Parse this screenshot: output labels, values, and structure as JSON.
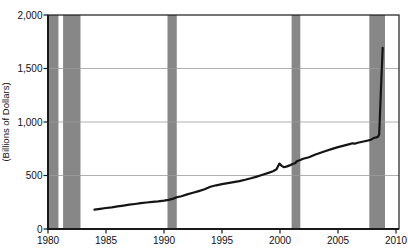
{
  "figure": {
    "title": "",
    "y_axis_title": "(Billions of Dollars)"
  },
  "colors": {
    "line": "#141414",
    "recession_band": "#878787",
    "gridline": "#9c9c9c",
    "frame": "#1a1a1a",
    "text": "#111111",
    "background": "#ffffff"
  },
  "chart_data": {
    "type": "line",
    "title": "",
    "xlabel": "",
    "ylabel": "(Billions of Dollars)",
    "xlim": [
      1980,
      2010.3
    ],
    "ylim": [
      0,
      2000
    ],
    "x_ticks": [
      1980,
      1985,
      1990,
      1995,
      2000,
      2005,
      2010
    ],
    "x_tick_labels": [
      "1980",
      "1985",
      "1990",
      "1995",
      "2000",
      "2005",
      "2010"
    ],
    "y_ticks": [
      0,
      500,
      1000,
      1500,
      2000
    ],
    "y_tick_labels": [
      "0",
      "500",
      "1,000",
      "1,500",
      "2,000"
    ],
    "grid": "horizontal gridlines at 500, 1000, 1500; plot frame on all four sides",
    "legend": "none",
    "recession_bands": [
      [
        1980.0,
        1980.9
      ],
      [
        1981.3,
        1982.8
      ],
      [
        1990.3,
        1991.1
      ],
      [
        2001.0,
        2001.75
      ],
      [
        2007.7,
        2009.05
      ]
    ],
    "series": [
      {
        "name": "monetary-aggregate-line",
        "points": [
          [
            1984,
            180
          ],
          [
            1984.5,
            188
          ],
          [
            1985,
            196
          ],
          [
            1985.5,
            203
          ],
          [
            1986,
            211
          ],
          [
            1986.5,
            219
          ],
          [
            1987,
            227
          ],
          [
            1987.5,
            234
          ],
          [
            1988,
            241
          ],
          [
            1988.5,
            248
          ],
          [
            1989,
            254
          ],
          [
            1989.5,
            259
          ],
          [
            1990,
            265
          ],
          [
            1990.4,
            272
          ],
          [
            1990.8,
            284
          ],
          [
            1991.1,
            296
          ],
          [
            1991.5,
            307
          ],
          [
            1992,
            323
          ],
          [
            1992.5,
            338
          ],
          [
            1993,
            354
          ],
          [
            1993.5,
            371
          ],
          [
            1994,
            395
          ],
          [
            1994.5,
            408
          ],
          [
            1995,
            420
          ],
          [
            1995.5,
            429
          ],
          [
            1996,
            438
          ],
          [
            1996.5,
            448
          ],
          [
            1997,
            460
          ],
          [
            1997.5,
            474
          ],
          [
            1998,
            490
          ],
          [
            1998.5,
            507
          ],
          [
            1999,
            524
          ],
          [
            1999.4,
            540
          ],
          [
            1999.7,
            558
          ],
          [
            1999.95,
            611
          ],
          [
            2000.15,
            590
          ],
          [
            2000.35,
            578
          ],
          [
            2000.6,
            585
          ],
          [
            2000.9,
            597
          ],
          [
            2001.15,
            610
          ],
          [
            2001.3,
            614
          ],
          [
            2001.45,
            634
          ],
          [
            2001.7,
            642
          ],
          [
            2002,
            656
          ],
          [
            2002.5,
            671
          ],
          [
            2003,
            693
          ],
          [
            2003.5,
            713
          ],
          [
            2004,
            731
          ],
          [
            2004.5,
            749
          ],
          [
            2005,
            765
          ],
          [
            2005.5,
            779
          ],
          [
            2006,
            793
          ],
          [
            2006.25,
            801
          ],
          [
            2006.45,
            797
          ],
          [
            2006.7,
            806
          ],
          [
            2007,
            813
          ],
          [
            2007.5,
            825
          ],
          [
            2007.8,
            833
          ],
          [
            2008,
            845
          ],
          [
            2008.15,
            852
          ],
          [
            2008.3,
            856
          ],
          [
            2008.45,
            862
          ],
          [
            2008.55,
            885
          ],
          [
            2008.65,
            1150
          ],
          [
            2008.75,
            1430
          ],
          [
            2008.85,
            1693
          ]
        ]
      }
    ]
  }
}
